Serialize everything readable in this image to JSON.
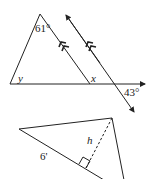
{
  "figure_top": {
    "description": "Triangle with a line parallel to one side crossing an extended base",
    "labels": {
      "apex_angle": "61°",
      "left_angle": "y",
      "inner_angle": "x",
      "exterior_angle": "43°"
    },
    "parallel_marks": "double arrows",
    "colors": {
      "stroke": "#222222",
      "background": "#ffffff"
    }
  },
  "figure_bottom": {
    "description": "Triangle with dashed altitude h and side length 6'",
    "labels": {
      "side": "6'",
      "altitude": "h"
    },
    "colors": {
      "stroke": "#222222"
    }
  }
}
